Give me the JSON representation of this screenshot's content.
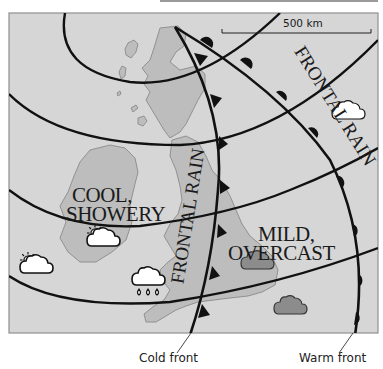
{
  "map": {
    "title": "Weather map of the British Isles showing fronts",
    "scale_bar": {
      "label": "500 km"
    },
    "regions": [
      {
        "id": "west",
        "lines": [
          "COOL,",
          "SHOWERY"
        ]
      },
      {
        "id": "east",
        "lines": [
          "MILD,",
          "OVERCAST"
        ]
      }
    ],
    "rain_bands": [
      {
        "id": "cold-front-band",
        "label": "FRONTAL RAIN"
      },
      {
        "id": "warm-front-band",
        "label": "FRONTAL RAIN"
      }
    ],
    "fronts": [
      {
        "id": "cold",
        "type": "cold front",
        "symbol": "triangles",
        "caption": "Cold front"
      },
      {
        "id": "warm",
        "type": "warm front",
        "symbol": "semicircles",
        "caption": "Warm front"
      }
    ],
    "weather_icons": [
      {
        "name": "sun-cloud-icon",
        "x": 103,
        "y": 240
      },
      {
        "name": "sun-cloud-icon",
        "x": 35,
        "y": 267
      },
      {
        "name": "rain-cloud-icon",
        "x": 148,
        "y": 280
      },
      {
        "name": "white-cloud-icon",
        "x": 348,
        "y": 113
      },
      {
        "name": "grey-cloud-icon",
        "x": 256,
        "y": 262
      },
      {
        "name": "grey-cloud-icon",
        "x": 290,
        "y": 308
      }
    ],
    "colors": {
      "sea": "#d6d6d6",
      "land": "#bdbdbd",
      "coast": "#8a8a8a",
      "front_line": "#111111",
      "grey_cloud": "#8c8c8c",
      "frame": "#8f8f8f"
    }
  }
}
